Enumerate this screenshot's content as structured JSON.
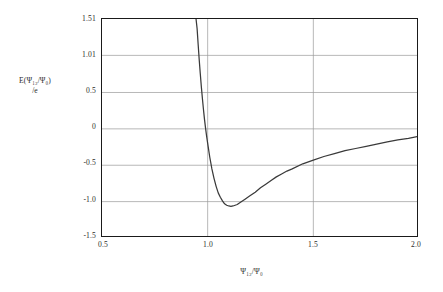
{
  "figure": {
    "background_color": "#ffffff",
    "frame_color": "#1a1a1a",
    "grid_color": "#9a9a9a",
    "curve_color": "#3a3a3a"
  },
  "axes": {
    "y_title_line1": "E(Ψ₁₂/Ψ₀)",
    "y_title_line2": "/e",
    "x_title": "Ψ₁₂/Ψ₀",
    "y_ticks": [
      "1.51",
      "1.01",
      "0.5",
      "0",
      "-0.5",
      "-1.0",
      "-1.5"
    ],
    "x_ticks": [
      "0.5",
      "1.0",
      "1.5",
      "2.0"
    ]
  },
  "chart_data": {
    "type": "line",
    "title": "",
    "subtitle": "",
    "xlabel": "Ψ₁₂/Ψ₀",
    "ylabel": "E(Ψ₁₂/Ψ₀)/e",
    "xlim": [
      0.5,
      2.0
    ],
    "ylim": [
      -1.5,
      1.51
    ],
    "x_ticks": [
      0.5,
      1.0,
      1.5,
      2.0
    ],
    "y_ticks": [
      1.51,
      1.01,
      0.5,
      0,
      -0.5,
      -1.0,
      -1.5
    ],
    "grid": true,
    "grid_orientation": "both",
    "legend": false,
    "legend_position": "none",
    "annotations": [],
    "series": [
      {
        "name": "E(Ψ₁₂/Ψ₀)/e",
        "color": "#3a3a3a",
        "x": [
          0.945,
          0.95,
          0.955,
          0.96,
          0.965,
          0.97,
          0.975,
          0.98,
          0.985,
          0.99,
          0.995,
          1.0,
          1.01,
          1.02,
          1.03,
          1.04,
          1.05,
          1.06,
          1.07,
          1.08,
          1.09,
          1.1,
          1.11,
          1.12,
          1.13,
          1.14,
          1.15,
          1.175,
          1.2,
          1.225,
          1.25,
          1.275,
          1.3,
          1.325,
          1.35,
          1.375,
          1.4,
          1.45,
          1.5,
          1.55,
          1.6,
          1.65,
          1.7,
          1.75,
          1.8,
          1.85,
          1.9,
          1.95,
          2.0
        ],
        "y": [
          1.51,
          1.38,
          1.16,
          0.95,
          0.76,
          0.58,
          0.42,
          0.27,
          0.13,
          0.01,
          -0.1,
          -0.2,
          -0.39,
          -0.55,
          -0.68,
          -0.79,
          -0.88,
          -0.94,
          -0.99,
          -1.03,
          -1.05,
          -1.06,
          -1.065,
          -1.06,
          -1.05,
          -1.04,
          -1.02,
          -0.97,
          -0.92,
          -0.87,
          -0.81,
          -0.76,
          -0.71,
          -0.66,
          -0.62,
          -0.58,
          -0.55,
          -0.48,
          -0.43,
          -0.38,
          -0.34,
          -0.3,
          -0.27,
          -0.24,
          -0.21,
          -0.18,
          -0.15,
          -0.13,
          -0.1
        ]
      }
    ],
    "features": {
      "minimum_x": 1.11,
      "minimum_y": -1.065,
      "zero_crossing_x": 0.99,
      "asymptote_right_y": -0.1,
      "divergence_x": 0.945
    }
  }
}
